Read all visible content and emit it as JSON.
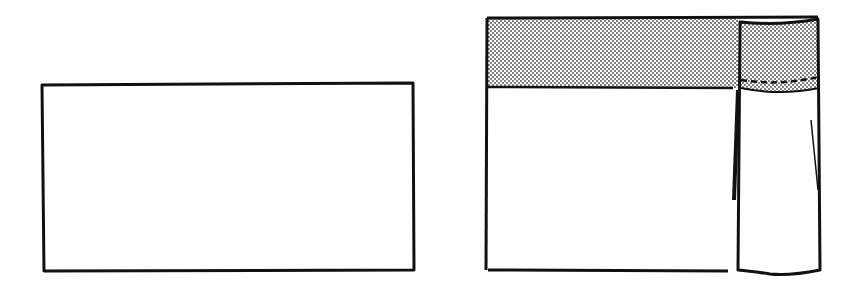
{
  "diagram": {
    "colors": {
      "stroke": "#111111",
      "background": "#ffffff",
      "dot_fill": "#444444"
    },
    "figures": [
      {
        "id": "step-1",
        "label": "",
        "shape": "plain-rectangle"
      },
      {
        "id": "step-2",
        "label": "",
        "shape": "rectangle-with-shaded-band-and-folded-panel"
      }
    ]
  }
}
